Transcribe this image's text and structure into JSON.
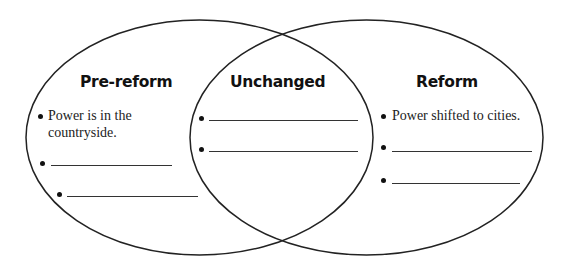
{
  "diagram": {
    "type": "venn",
    "circles": [
      {
        "heading": "Pre-reform",
        "items": [
          "Power is in the countryside.",
          "",
          ""
        ]
      },
      {
        "heading": "Unchanged",
        "items": [
          "",
          ""
        ]
      },
      {
        "heading": "Reform",
        "items": [
          "Power shifted to cities.",
          "",
          ""
        ]
      }
    ],
    "line_color": "#222222"
  }
}
